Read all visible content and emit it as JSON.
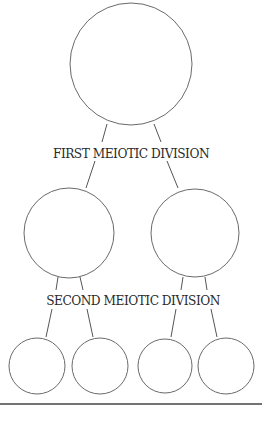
{
  "diagram": {
    "labels": {
      "first_division": "FIRST MEIOTIC DIVISION",
      "second_division": "SECOND MEIOTIC DIVISION"
    },
    "cells": {
      "parent": {
        "cx": 131,
        "cy": 64,
        "r": 61
      },
      "first_division_products": [
        {
          "cx": 69,
          "cy": 233,
          "r": 45
        },
        {
          "cx": 195,
          "cy": 233,
          "r": 44
        }
      ],
      "second_division_products": [
        {
          "cx": 37,
          "cy": 366,
          "r": 28
        },
        {
          "cx": 100,
          "cy": 366,
          "r": 28
        },
        {
          "cx": 165,
          "cy": 366,
          "r": 27
        },
        {
          "cx": 226,
          "cy": 366,
          "r": 28
        }
      ]
    },
    "colors": {
      "outline": "#6a6a6a",
      "text": "#2a2a2a",
      "rule": "#444444"
    }
  }
}
